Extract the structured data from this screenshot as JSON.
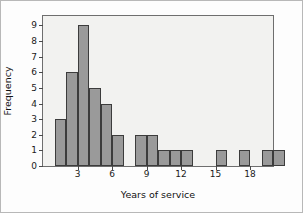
{
  "chart_data": {
    "type": "bar",
    "title": "",
    "xlabel": "Years of service",
    "ylabel": "Frequency",
    "xlim": [
      0,
      20
    ],
    "ylim": [
      0,
      9.6
    ],
    "bin_width": 1,
    "grid": false,
    "legend": null,
    "xticks": [
      3,
      6,
      9,
      12,
      15,
      18
    ],
    "xtick_labels": [
      "3",
      "6",
      "9",
      "12",
      "15",
      "18"
    ],
    "yticks": [
      0,
      1,
      2,
      3,
      4,
      5,
      6,
      7,
      8,
      9
    ],
    "ytick_labels": [
      "0",
      "1",
      "2",
      "3",
      "4",
      "5",
      "6",
      "7",
      "8",
      "9"
    ],
    "bin_edges": [
      1,
      2,
      3,
      4,
      5,
      6,
      7,
      8,
      9,
      10,
      11,
      12,
      13,
      14,
      15,
      16,
      17,
      18,
      19,
      20
    ],
    "bins": [
      {
        "x0": 1,
        "x1": 2,
        "value": 3
      },
      {
        "x0": 2,
        "x1": 3,
        "value": 6
      },
      {
        "x0": 3,
        "x1": 4,
        "value": 9
      },
      {
        "x0": 4,
        "x1": 5,
        "value": 5
      },
      {
        "x0": 5,
        "x1": 6,
        "value": 4
      },
      {
        "x0": 6,
        "x1": 7,
        "value": 2
      },
      {
        "x0": 7,
        "x1": 8,
        "value": 0
      },
      {
        "x0": 8,
        "x1": 9,
        "value": 2
      },
      {
        "x0": 9,
        "x1": 10,
        "value": 2
      },
      {
        "x0": 10,
        "x1": 11,
        "value": 1
      },
      {
        "x0": 11,
        "x1": 12,
        "value": 1
      },
      {
        "x0": 12,
        "x1": 13,
        "value": 1
      },
      {
        "x0": 13,
        "x1": 14,
        "value": 0
      },
      {
        "x0": 14,
        "x1": 15,
        "value": 0
      },
      {
        "x0": 15,
        "x1": 16,
        "value": 1
      },
      {
        "x0": 16,
        "x1": 17,
        "value": 0
      },
      {
        "x0": 17,
        "x1": 18,
        "value": 1
      },
      {
        "x0": 18,
        "x1": 19,
        "value": 0
      },
      {
        "x0": 19,
        "x1": 20,
        "value": 1
      },
      {
        "x0": 20,
        "x1": 21,
        "value": 1
      }
    ],
    "categories": [
      "1-2",
      "2-3",
      "3-4",
      "4-5",
      "5-6",
      "6-7",
      "7-8",
      "8-9",
      "9-10",
      "10-11",
      "11-12",
      "12-13",
      "13-14",
      "14-15",
      "15-16",
      "16-17",
      "17-18",
      "18-19",
      "19-20",
      "20-21"
    ],
    "values": [
      3,
      6,
      9,
      5,
      4,
      2,
      0,
      2,
      2,
      1,
      1,
      1,
      0,
      0,
      1,
      0,
      1,
      0,
      1,
      1
    ],
    "colors": {
      "bar_fill": "#9a9a9a",
      "bar_edge": "#3c3c3c",
      "plot_background": "#f2f2f0",
      "frame": "#6e6e6e",
      "outer_border": "#b8b8b8",
      "text": "#1a1a1a"
    }
  }
}
